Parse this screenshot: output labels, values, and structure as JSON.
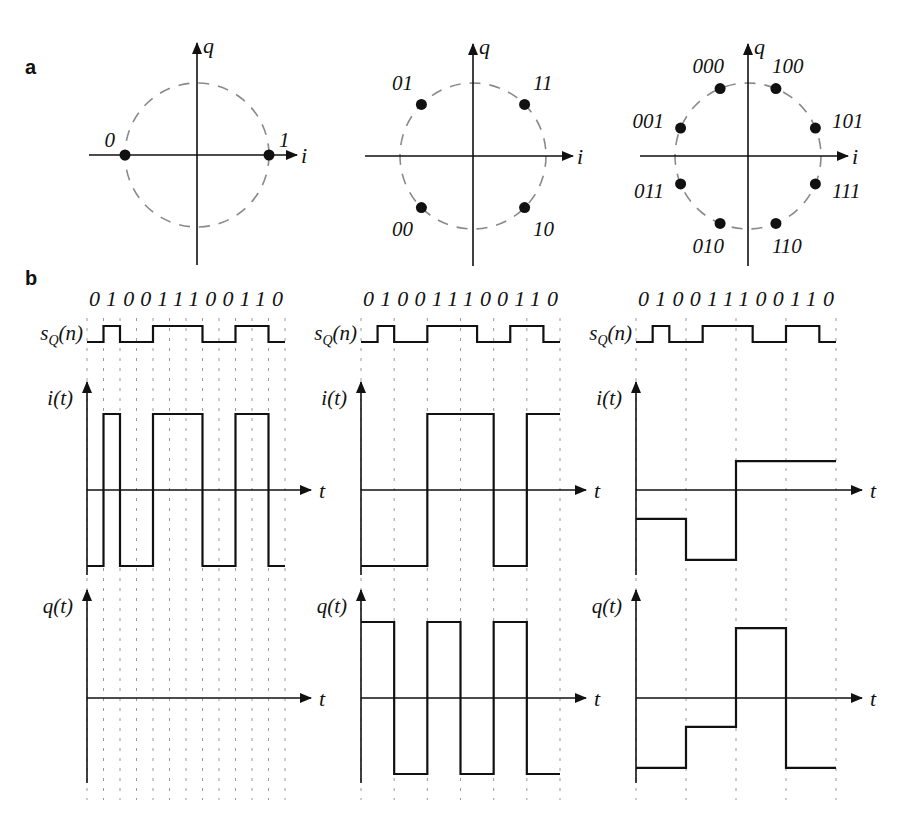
{
  "figure": {
    "panel_a_label": "a",
    "panel_b_label": "b",
    "constellations": [
      {
        "name": "BPSK",
        "center": [
          197,
          155
        ],
        "radius": 72,
        "axis_labels": {
          "x": "i",
          "y": "q"
        },
        "points": [
          {
            "label": "0",
            "angle_deg": 180
          },
          {
            "label": "1",
            "angle_deg": 0
          }
        ]
      },
      {
        "name": "QPSK",
        "center": [
          473,
          156
        ],
        "radius": 73,
        "axis_labels": {
          "x": "i",
          "y": "q"
        },
        "points": [
          {
            "label": "11",
            "angle_deg": 45
          },
          {
            "label": "01",
            "angle_deg": 135
          },
          {
            "label": "00",
            "angle_deg": 225
          },
          {
            "label": "10",
            "angle_deg": 315
          }
        ]
      },
      {
        "name": "8PSK",
        "center": [
          748,
          156
        ],
        "radius": 73,
        "axis_labels": {
          "x": "i",
          "y": "q"
        },
        "points": [
          {
            "label": "101",
            "angle_deg": 22.5
          },
          {
            "label": "100",
            "angle_deg": 67.5
          },
          {
            "label": "000",
            "angle_deg": 112.5
          },
          {
            "label": "001",
            "angle_deg": 157.5
          },
          {
            "label": "011",
            "angle_deg": 202.5
          },
          {
            "label": "010",
            "angle_deg": 247.5
          },
          {
            "label": "110",
            "angle_deg": 292.5
          },
          {
            "label": "111",
            "angle_deg": 337.5
          }
        ]
      }
    ],
    "timing": {
      "bit_string": "010011100110",
      "bits": [
        0,
        1,
        0,
        0,
        1,
        1,
        1,
        0,
        0,
        1,
        1,
        0
      ],
      "signal_label_s": "s",
      "signal_label_s_sub": "Q",
      "signal_label_s_arg": "(n)",
      "i_label": "i(t)",
      "q_label": "q(t)",
      "t_label": "t",
      "columns": [
        {
          "name": "BPSK",
          "x0": 87,
          "x1": 285,
          "bits_per_symbol": 1,
          "i_levels": [
            -1,
            1,
            -1,
            -1,
            1,
            1,
            1,
            -1,
            -1,
            1,
            1,
            -1
          ],
          "q_levels": [
            0,
            0,
            0,
            0,
            0,
            0,
            0,
            0,
            0,
            0,
            0,
            0
          ]
        },
        {
          "name": "QPSK",
          "x0": 361,
          "x1": 560,
          "bits_per_symbol": 2,
          "i_levels": [
            -1,
            -1,
            1,
            1,
            -1,
            1
          ],
          "q_levels": [
            1,
            -1,
            1,
            -1,
            1,
            -1
          ]
        },
        {
          "name": "8PSK",
          "x0": 636,
          "x1": 836,
          "bits_per_symbol": 3,
          "i_levels": [
            -0.38,
            -0.92,
            0.38,
            0.38
          ],
          "q_levels": [
            -0.92,
            -0.38,
            0.92,
            -0.92
          ]
        }
      ]
    }
  }
}
